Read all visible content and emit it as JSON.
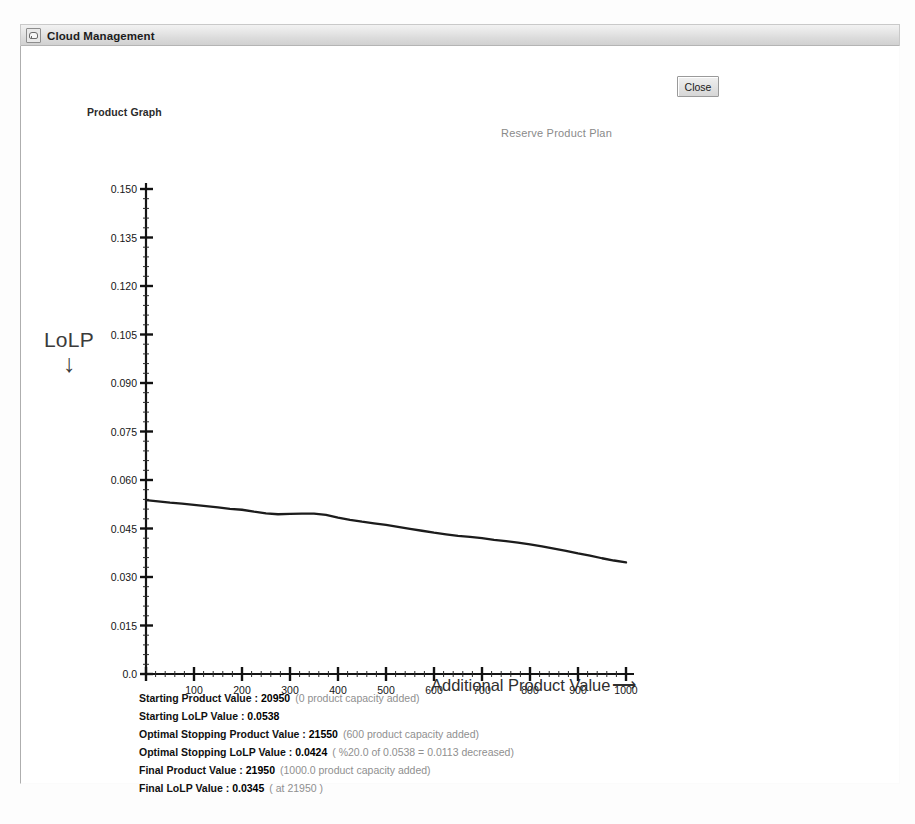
{
  "window": {
    "title": "Cloud Management",
    "icon": "app-window-icon"
  },
  "toolbar": {
    "close_label": "Close"
  },
  "panel": {
    "product_graph_label": "Product Graph"
  },
  "axis": {
    "y_caption": "LoLP",
    "y_arrow": "↓",
    "x_title": "Additional Product Value",
    "x_arrow": "⟶"
  },
  "summary": [
    {
      "label": "Starting Product Value :",
      "value": "20950",
      "note": "(0 product capacity added)"
    },
    {
      "label": "Starting LoLP Value :",
      "value": "0.0538",
      "note": ""
    },
    {
      "label": "Optimal Stopping Product Value :",
      "value": "21550",
      "note": "(600 product capacity added)"
    },
    {
      "label": "Optimal Stopping LoLP Value :",
      "value": "0.0424",
      "note": "( %20.0 of 0.0538 = 0.0113 decreased)"
    },
    {
      "label": "Final Product Value :",
      "value": "21950",
      "note": "(1000.0 product capacity added)"
    },
    {
      "label": "Final LoLP Value :",
      "value": "0.0345",
      "note": "( at 21950 )"
    }
  ],
  "chart_data": {
    "type": "line",
    "title": "Reserve Product Plan",
    "xlabel": "Additional Product Value",
    "ylabel": "LoLP",
    "xlim": [
      0,
      1000
    ],
    "ylim": [
      0.0,
      0.15
    ],
    "grid": false,
    "legend": "none",
    "line_color": "#1c1c1c",
    "xticks": [
      0,
      100,
      200,
      300,
      400,
      500,
      600,
      700,
      800,
      900,
      1000
    ],
    "xtick_labels": [
      "",
      "100",
      "200",
      "300",
      "400",
      "500",
      "600",
      "700",
      "800",
      "900",
      "1000"
    ],
    "yticks": [
      0.0,
      0.015,
      0.03,
      0.045,
      0.06,
      0.075,
      0.09,
      0.105,
      0.12,
      0.135,
      0.15
    ],
    "ytick_labels": [
      "0.0",
      "0.015",
      "0.030",
      "0.045",
      "0.060",
      "0.075",
      "0.090",
      "0.105",
      "0.120",
      "0.135",
      "0.150"
    ],
    "x": [
      0,
      25,
      50,
      75,
      100,
      125,
      150,
      175,
      200,
      225,
      250,
      275,
      300,
      325,
      350,
      375,
      400,
      425,
      450,
      475,
      500,
      525,
      550,
      575,
      600,
      625,
      650,
      675,
      700,
      725,
      750,
      775,
      800,
      825,
      850,
      875,
      900,
      925,
      950,
      975,
      1000
    ],
    "y": [
      0.0538,
      0.0534,
      0.053,
      0.0527,
      0.0523,
      0.0519,
      0.0515,
      0.0511,
      0.0508,
      0.0502,
      0.0497,
      0.0494,
      0.0495,
      0.0496,
      0.0496,
      0.0492,
      0.0484,
      0.0477,
      0.0471,
      0.0466,
      0.0461,
      0.0455,
      0.0449,
      0.0443,
      0.0437,
      0.0432,
      0.0427,
      0.0424,
      0.042,
      0.0415,
      0.0411,
      0.0406,
      0.0401,
      0.0395,
      0.0388,
      0.0381,
      0.0373,
      0.0366,
      0.0358,
      0.0351,
      0.0345
    ]
  }
}
